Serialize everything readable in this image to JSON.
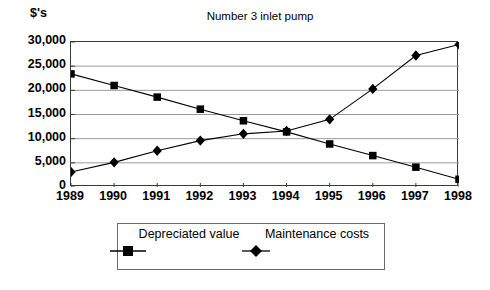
{
  "chart_data": {
    "type": "line",
    "title": "Number 3 inlet pump",
    "xlabel": "",
    "ylabel": "$'s",
    "categories": [
      "1989",
      "1990",
      "1991",
      "1992",
      "1993",
      "1994",
      "1995",
      "1996",
      "1997",
      "1998"
    ],
    "series": [
      {
        "name": "Depreciated value",
        "marker": "square",
        "values": [
          23400,
          21000,
          18600,
          16100,
          13700,
          11400,
          8900,
          6500,
          4100,
          1600
        ]
      },
      {
        "name": "Maintenance costs",
        "marker": "diamond",
        "values": [
          3100,
          5100,
          7500,
          9600,
          11000,
          11600,
          14000,
          20300,
          27200,
          29500
        ]
      }
    ],
    "ylim": [
      0,
      30000
    ],
    "yticks": [
      0,
      5000,
      10000,
      15000,
      20000,
      25000,
      30000
    ],
    "ytick_labels": [
      "0",
      "5,000",
      "10,000",
      "15,000",
      "20,000",
      "25,000",
      "30,000"
    ],
    "grid": true,
    "grid_axis": "y",
    "legend_position": "bottom",
    "colors": {
      "line": "#000000",
      "marker": "#000000",
      "grid": "#9a9a9a",
      "axis": "#3a3a3a",
      "background": "#ffffff"
    }
  },
  "axis": {
    "y_unit_label": "$'s"
  },
  "legend": {
    "entries": [
      {
        "label": "Depreciated value",
        "marker": "square"
      },
      {
        "label": "Maintenance costs",
        "marker": "diamond"
      }
    ]
  }
}
